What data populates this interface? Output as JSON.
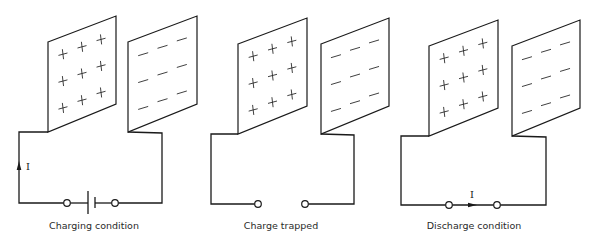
{
  "figure": {
    "colors": {
      "line": "#1a1a1a",
      "background": "#ffffff",
      "text": "#2a2a2a"
    },
    "panels": [
      {
        "id": "charging",
        "caption": "Charging condition",
        "caption_x": 94,
        "plate_left": {
          "tl": [
            48,
            42
          ],
          "tr": [
            116,
            16
          ],
          "br": [
            116,
            104
          ],
          "bl": [
            48,
            132
          ]
        },
        "plate_right": {
          "tl": [
            128,
            42
          ],
          "tr": [
            197,
            16
          ],
          "br": [
            197,
            104
          ],
          "bl": [
            128,
            132
          ]
        },
        "wire_left_x": 19,
        "wire_right_x": 162,
        "wire_bottom_y": 203,
        "terminals": [
          67,
          115
        ],
        "battery": {
          "present": true,
          "long_x": 88,
          "short_x": 95
        },
        "current": {
          "label": "I",
          "direction": "up",
          "x": 19,
          "y": 166
        },
        "left_plate_charge": "+",
        "right_plate_charge": "−"
      },
      {
        "id": "trapped",
        "caption": "Charge trapped",
        "caption_x": 281,
        "plate_left": {
          "tl": [
            238,
            44
          ],
          "tr": [
            307,
            18
          ],
          "br": [
            307,
            106
          ],
          "bl": [
            238,
            134
          ]
        },
        "plate_right": {
          "tl": [
            321,
            44
          ],
          "tr": [
            389,
            18
          ],
          "br": [
            389,
            106
          ],
          "bl": [
            321,
            134
          ]
        },
        "wire_left_x": 211,
        "wire_right_x": 354,
        "wire_bottom_y": 204,
        "terminals": [
          258,
          305
        ],
        "battery": {
          "present": false
        },
        "current": null,
        "left_plate_charge": "+",
        "right_plate_charge": "−"
      },
      {
        "id": "discharge",
        "caption": "Discharge condition",
        "caption_x": 474,
        "plate_left": {
          "tl": [
            429,
            46
          ],
          "tr": [
            498,
            20
          ],
          "br": [
            498,
            108
          ],
          "bl": [
            429,
            136
          ]
        },
        "plate_right": {
          "tl": [
            512,
            46
          ],
          "tr": [
            580,
            20
          ],
          "br": [
            580,
            108
          ],
          "bl": [
            512,
            136
          ]
        },
        "wire_left_x": 401,
        "wire_right_x": 546,
        "wire_bottom_y": 205,
        "terminals": [
          449,
          497
        ],
        "battery": {
          "present": false
        },
        "current": {
          "label": "I",
          "direction": "right",
          "x": 472,
          "y": 205
        },
        "left_plate_charge": "+",
        "right_plate_charge": "−"
      }
    ]
  },
  "captions": {
    "charging": "Charging condition",
    "trapped": "Charge trapped",
    "discharge": "Discharge condition"
  },
  "current_label": "I"
}
